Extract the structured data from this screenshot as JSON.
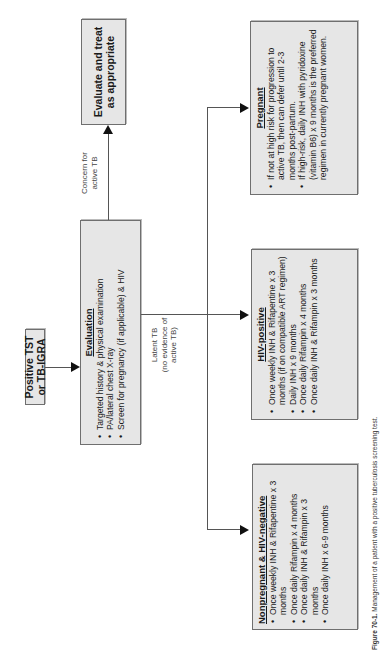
{
  "diagram": {
    "start": {
      "label": "Positive TST or TB-IGRA"
    },
    "evaluation": {
      "title": "Evaluation",
      "items": [
        "Targeted history & physical examination",
        "PA/lateral chest X-ray",
        "Screen for pregnancy (if applicable) & HIV"
      ]
    },
    "active_branch": {
      "edge_label_line1": "Concern for",
      "edge_label_line2": "active TB",
      "box_line1": "Evaluate and treat",
      "box_line2": "as appropriate"
    },
    "latent_branch": {
      "edge_label_line1": "Latent TB",
      "edge_label_line2": "(no evidence of",
      "edge_label_line3": "active TB)"
    },
    "nonpregnant": {
      "title": "Nonpregnant & HIV-negative",
      "items": [
        "Once weekly INH & Rifapentine x 3 months",
        "Once daily Rifampin x 4 months",
        "Once daily INH & Rifampin x 3 months",
        "Once daily INH x 6-9 months"
      ]
    },
    "hiv_positive": {
      "title": "HIV-positive",
      "items": [
        "Once weekly INH & Rifapentine x 3 months (if on compatible ART regimen)",
        "Daily INH x 9 months",
        "Once daily Rifampin x 4 months",
        "Once daily INH & Rifampin x 3 months"
      ]
    },
    "pregnant": {
      "title": "Pregnant",
      "items": [
        "If not at high risk for progression to active TB, then can defer until 2-3 months post-partum.",
        "If high-risk, daily INH with pyridoxine (vitamin B6) x 9 months is the preferred regimen in currently pregnant women."
      ]
    }
  },
  "caption": {
    "label": "Figure 70-1.",
    "text": "Management of a patient with a positive tuberculosis screening test."
  },
  "colors": {
    "box_fill": "#e6e6e6",
    "box_border": "#6f6f6f",
    "line": "#555555",
    "arrow": "#111111"
  }
}
